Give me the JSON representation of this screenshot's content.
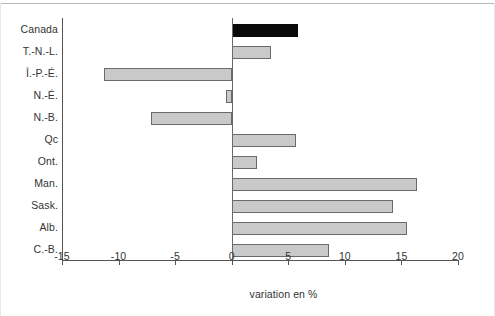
{
  "chart_data": {
    "type": "bar",
    "orientation": "horizontal",
    "title": "",
    "subtitle": "",
    "xlabel": "variation en %",
    "ylabel": "",
    "xlim": [
      -15,
      20
    ],
    "xticks": [
      -15,
      -10,
      -5,
      0,
      5,
      10,
      15,
      20
    ],
    "xticklabels": [
      "-15",
      "-10",
      "-5",
      "0",
      "5",
      "10",
      "15",
      "20"
    ],
    "grid": false,
    "legend": null,
    "zero_line": 0,
    "categories": [
      "Canada",
      "T.-N.-L.",
      "Î.-P.-É.",
      "N.-É.",
      "N.-B.",
      "Qc",
      "Ont.",
      "Man.",
      "Sask.",
      "Alb.",
      "C.-B."
    ],
    "values": [
      5.9,
      3.5,
      -11.3,
      -0.5,
      -7.1,
      5.7,
      2.2,
      16.4,
      14.3,
      15.5,
      8.6
    ],
    "bar_styles": [
      "highlight",
      "normal",
      "normal",
      "normal",
      "normal",
      "normal",
      "normal",
      "normal",
      "normal",
      "normal",
      "normal"
    ],
    "colors": {
      "bar_fill": "#c9c9c9",
      "bar_edge": "#6a6a6a",
      "highlight_fill": "#0a0a0a",
      "axis": "#555555",
      "text": "#333333",
      "background": "#ffffff"
    }
  }
}
